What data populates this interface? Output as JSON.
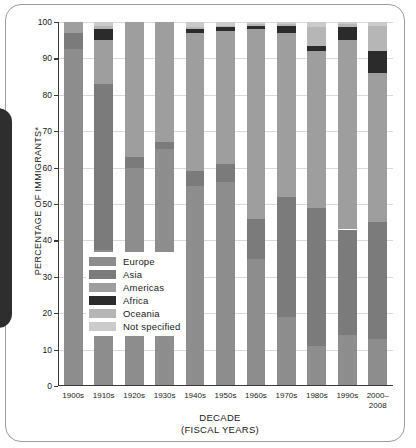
{
  "chart_data": {
    "type": "bar",
    "subtype": "stacked-percentage",
    "title": "",
    "xlabel": "DECADE",
    "xlabel_sub": "(FISCAL YEARS)",
    "ylabel": "PERCENTAGE OF IMMIGRANTS*",
    "ylim": [
      0,
      100
    ],
    "yticks": [
      0,
      10,
      20,
      30,
      40,
      50,
      60,
      70,
      80,
      90,
      100
    ],
    "grid": true,
    "legend_position": "inside-lower-left",
    "categories": [
      "1900s",
      "1910s",
      "1920s",
      "1930s",
      "1940s",
      "1950s",
      "1960s",
      "1970s",
      "1980s",
      "1990s",
      "2000-2008"
    ],
    "series": [
      {
        "name": "Europe",
        "color": "#8d8d8d",
        "values": [
          92.5,
          37.5,
          60.0,
          65.0,
          55.0,
          56.0,
          35.0,
          19.0,
          11.0,
          14.0,
          13.0
        ]
      },
      {
        "name": "Asia",
        "color": "#7b7b7b",
        "values": [
          4.5,
          45.5,
          2.8,
          2.0,
          4.0,
          5.0,
          11.0,
          33.0,
          38.0,
          29.0,
          32.0
        ]
      },
      {
        "name": "Americas",
        "color": "#9e9e9e",
        "values": [
          3.0,
          12.0,
          37.2,
          33.0,
          38.0,
          36.5,
          52.0,
          45.0,
          43.0,
          52.0,
          41.0
        ]
      },
      {
        "name": "Africa",
        "color": "#2b2b2b",
        "values": [
          0.0,
          3.0,
          0.0,
          0.0,
          1.0,
          1.0,
          1.0,
          2.0,
          1.5,
          3.5,
          6.0
        ]
      },
      {
        "name": "Oceania",
        "color": "#b6b6b6",
        "values": [
          0.0,
          1.0,
          0.0,
          0.0,
          0.5,
          0.5,
          0.5,
          0.5,
          5.0,
          1.0,
          7.0
        ]
      },
      {
        "name": "Not specified",
        "color": "#cbcbcb",
        "values": [
          0.0,
          1.0,
          0.0,
          0.0,
          1.5,
          1.0,
          0.5,
          0.5,
          1.5,
          0.5,
          1.0
        ]
      }
    ]
  },
  "legend": {
    "items": [
      {
        "label": "Europe"
      },
      {
        "label": "Asia"
      },
      {
        "label": "Americas"
      },
      {
        "label": "Africa"
      },
      {
        "label": "Oceania"
      },
      {
        "label": "Not specified"
      }
    ]
  }
}
